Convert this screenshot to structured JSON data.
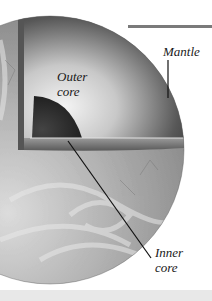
{
  "figure": {
    "labels": {
      "mantle": "Mantle",
      "outer_core": [
        "Outer",
        "core"
      ],
      "inner_core": [
        "Inner",
        "core"
      ]
    },
    "colors": {
      "background": "#ffffff",
      "surface": "#a8a8a8",
      "mantle_dark": "#3a3a3a",
      "mantle_light": "#f2f2f2",
      "inner_core": "#262626",
      "top_bar": "#7a7a7a",
      "leader_line": "#111111"
    }
  }
}
